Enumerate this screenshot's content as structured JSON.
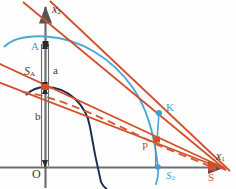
{
  "figure": {
    "type": "geometry-diagram",
    "background": "#fefefe",
    "width": 236,
    "height": 189
  },
  "colors": {
    "axis": "#6e6e6e",
    "ellipse": "#4aa6d4",
    "circle": "#1d2a52",
    "line": "#d4502a",
    "point_blue": "#3f9fd0",
    "point_orange": "#d4502a",
    "text_dark": "#4a4a4a"
  },
  "axes": {
    "x_axis_label": "x",
    "x_axis_sub": "1",
    "y_axis_label": "x",
    "y_axis_sub": "2",
    "origin_label": "O",
    "origin_px": [
      45,
      167
    ]
  },
  "points": [
    {
      "name": "A",
      "label": "A",
      "sub": "",
      "px": [
        45,
        44
      ],
      "color": "#3f9fd0",
      "label_px": [
        31,
        41
      ]
    },
    {
      "name": "SA",
      "label": "S",
      "sub": "A",
      "px": [
        45,
        87
      ],
      "color": "#d4502a",
      "label_px": [
        25,
        66
      ]
    },
    {
      "name": "K",
      "label": "K",
      "sub": "",
      "px": [
        159,
        113
      ],
      "color": "#3f9fd0",
      "label_px": [
        165,
        104
      ]
    },
    {
      "name": "P",
      "label": "P",
      "sub": "",
      "px": [
        157,
        140
      ],
      "color": "#d4502a",
      "label_px": [
        144,
        143
      ]
    },
    {
      "name": "S2",
      "label": "S",
      "sub": "2",
      "px": [
        158,
        167
      ],
      "color": "#3f9fd0",
      "label_px": [
        167,
        170
      ]
    },
    {
      "name": "S",
      "label": "S",
      "sub": "",
      "px": [
        212,
        167
      ],
      "color": "#d4502a",
      "label_px": [
        209,
        172
      ]
    }
  ],
  "dimensions": [
    {
      "name": "a",
      "label": "a",
      "from_px": [
        45,
        44
      ],
      "to_px": [
        45,
        87
      ],
      "label_px": [
        52,
        65
      ]
    },
    {
      "name": "b",
      "label": "b",
      "from_px": [
        45,
        87
      ],
      "to_px": [
        45,
        167
      ],
      "label_px": [
        36,
        112
      ]
    }
  ],
  "curves": {
    "ellipse_label": "ellipse-arc",
    "circle_label": "circle-arc",
    "solid_lines": 4,
    "dashed_lines": 1
  }
}
